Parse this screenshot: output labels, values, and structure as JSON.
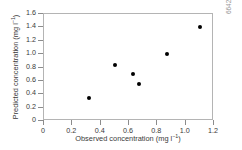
{
  "chart_data": {
    "type": "scatter",
    "title": "",
    "xlabel": "Observed concentration (mg l⁻¹)",
    "ylabel": "Predicted concentration (mg l⁻¹)",
    "xlabel_parts": {
      "text": "Observed concentration (mg l",
      "sup": "−1",
      "tail": ")"
    },
    "ylabel_parts": {
      "text": "Predicted concentration (mg l",
      "sup": "−1",
      "tail": ")"
    },
    "xlim": [
      0,
      1.2
    ],
    "ylim": [
      0,
      1.6
    ],
    "xticks": [
      "0",
      "0.2",
      "0.4",
      "0.6",
      "0.8",
      "1.0",
      "1.2"
    ],
    "xtick_values": [
      0,
      0.2,
      0.4,
      0.6,
      0.8,
      1.0,
      1.2
    ],
    "yticks": [
      "0",
      "0.2",
      "0.4",
      "0.6",
      "0.8",
      "1.0",
      "1.2",
      "1.4",
      "1.6"
    ],
    "ytick_values": [
      0,
      0.2,
      0.4,
      0.6,
      0.8,
      1.0,
      1.2,
      1.4,
      1.6
    ],
    "grid": false,
    "legend": null,
    "marker": "filled-circle",
    "marker_color": "#000000",
    "axis_color": "#b4b4b4",
    "text_color": "#3a3a3a",
    "x": [
      0.32,
      0.5,
      0.63,
      0.67,
      0.87,
      1.1
    ],
    "y": [
      0.34,
      0.84,
      0.7,
      0.56,
      1.0,
      1.4
    ],
    "points": [
      {
        "x": 0.32,
        "y": 0.34
      },
      {
        "x": 0.5,
        "y": 0.84
      },
      {
        "x": 0.63,
        "y": 0.7
      },
      {
        "x": 0.67,
        "y": 0.56
      },
      {
        "x": 0.87,
        "y": 1.0
      },
      {
        "x": 1.1,
        "y": 1.4
      }
    ]
  },
  "side_id": "6642"
}
